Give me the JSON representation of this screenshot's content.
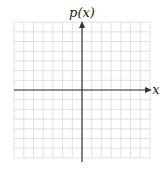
{
  "chart_data": {
    "type": "line",
    "title": "",
    "xlabel": "x",
    "ylabel": "p(x)",
    "grid": true,
    "series": [],
    "x_ticks": [],
    "y_ticks": [],
    "grid_cells_x": [
      -7,
      7
    ],
    "grid_cells_y": [
      -7,
      7
    ],
    "axis_arrows": [
      "x-positive",
      "y-positive"
    ]
  },
  "labels": {
    "y_axis": "p(x)",
    "x_axis": "x"
  },
  "colors": {
    "grid": "#d9d9d9",
    "axis": "#333333",
    "background": "#ffffff"
  }
}
